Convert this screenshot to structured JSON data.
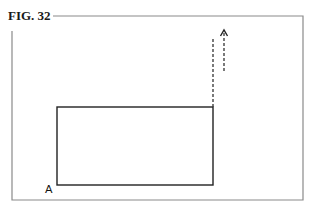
{
  "figure": {
    "label": "FIG. 32",
    "point_label": "A",
    "top_cut_text": "",
    "colors": {
      "frame": "#8a8a8a",
      "rectangle": "#222222",
      "dashed": "#333333",
      "text": "#1a1a1a"
    },
    "frame": {
      "left": 12,
      "top": 16,
      "right": 303,
      "bottom": 200
    },
    "rectangle": {
      "left": 57,
      "top": 107,
      "right": 213,
      "bottom": 185
    },
    "dashed_line": {
      "x": 213,
      "y1": 38,
      "y2": 107
    },
    "dashed_arrow": {
      "x": 224,
      "y_tail": 71,
      "y_head": 30,
      "direction": "up"
    }
  }
}
